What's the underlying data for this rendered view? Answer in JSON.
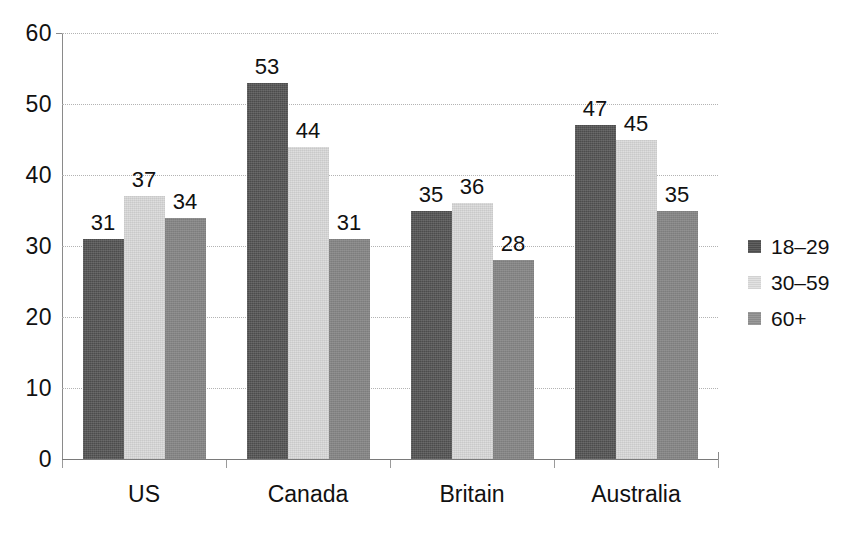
{
  "chart_data": {
    "type": "bar",
    "title": "",
    "subtitle": "",
    "xlabel": "",
    "ylabel": "",
    "categories": [
      "US",
      "Canada",
      "Britain",
      "Australia"
    ],
    "series": [
      {
        "name": "18–29",
        "values": [
          31,
          53,
          35,
          47
        ],
        "color": "#4c4c4c"
      },
      {
        "name": "30–59",
        "values": [
          37,
          44,
          36,
          45
        ],
        "color": "#dedede"
      },
      {
        "name": "60+",
        "values": [
          34,
          31,
          28,
          35
        ],
        "color": "#858585"
      }
    ],
    "ylim": [
      0,
      60
    ],
    "yticks": [
      0,
      10,
      20,
      30,
      40,
      50,
      60
    ],
    "ytick_labels": [
      "0",
      "10",
      "20",
      "30",
      "40",
      "50",
      "60"
    ],
    "grid": true,
    "grid_style": "dotted",
    "legend_position": "right",
    "data_labels": true,
    "background": "#ffffff"
  },
  "legend": {
    "entries": [
      {
        "label": "18–29"
      },
      {
        "label": "30–59"
      },
      {
        "label": "60+"
      }
    ]
  }
}
